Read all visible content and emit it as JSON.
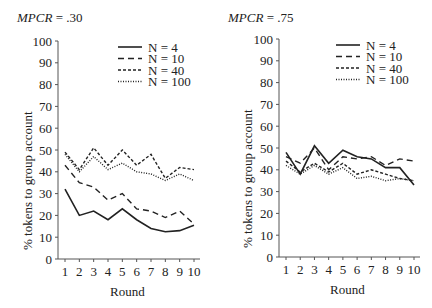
{
  "chart_data": [
    {
      "type": "line",
      "title": "MPCR = .30",
      "title_label": "MPCR",
      "title_value": " = .30",
      "xlabel": "Round",
      "ylabel": "% tokens to group account",
      "x": [
        1,
        2,
        3,
        4,
        5,
        6,
        7,
        8,
        9,
        10
      ],
      "ylim": [
        0,
        100
      ],
      "yticks": [
        0,
        10,
        20,
        30,
        40,
        50,
        60,
        70,
        80,
        90,
        100
      ],
      "grid": false,
      "legend_position": "upper right",
      "series": [
        {
          "name": "N = 4",
          "style": "solid",
          "values": [
            32,
            20,
            22,
            18,
            23,
            18,
            14,
            12.5,
            13,
            15.5
          ]
        },
        {
          "name": "N = 10",
          "style": "dashed",
          "values": [
            43,
            35,
            33,
            27,
            30,
            23,
            22,
            19,
            22,
            16
          ]
        },
        {
          "name": "N = 40",
          "style": "dense-dashed",
          "values": [
            49,
            41,
            51,
            43,
            50,
            43,
            48,
            37,
            42,
            41
          ]
        },
        {
          "name": "N = 100",
          "style": "dotted",
          "values": [
            48,
            40,
            47,
            41,
            44,
            40,
            39,
            36,
            39,
            36
          ]
        }
      ]
    },
    {
      "type": "line",
      "title": "MPCR = .75",
      "title_label": "MPCR",
      "title_value": " = .75",
      "xlabel": "Round",
      "ylabel": "% tokens to group account",
      "x": [
        1,
        2,
        3,
        4,
        5,
        6,
        7,
        8,
        9,
        10
      ],
      "ylim": [
        0,
        100
      ],
      "yticks": [
        0,
        10,
        20,
        30,
        40,
        50,
        60,
        70,
        80,
        90,
        100
      ],
      "grid": false,
      "legend_position": "upper right",
      "series": [
        {
          "name": "N = 4",
          "style": "solid",
          "values": [
            48,
            38,
            51,
            43,
            49,
            46,
            45,
            41,
            41,
            33
          ]
        },
        {
          "name": "N = 10",
          "style": "dashed",
          "values": [
            46,
            43,
            50,
            40,
            46,
            45,
            46,
            42,
            45,
            44
          ]
        },
        {
          "name": "N = 40",
          "style": "dense-dashed",
          "values": [
            44,
            39,
            43,
            39,
            43,
            38,
            40,
            38,
            36,
            35
          ]
        },
        {
          "name": "N = 100",
          "style": "dotted",
          "values": [
            42,
            38,
            42,
            38,
            41,
            36,
            37,
            35,
            36,
            35
          ]
        }
      ]
    }
  ]
}
